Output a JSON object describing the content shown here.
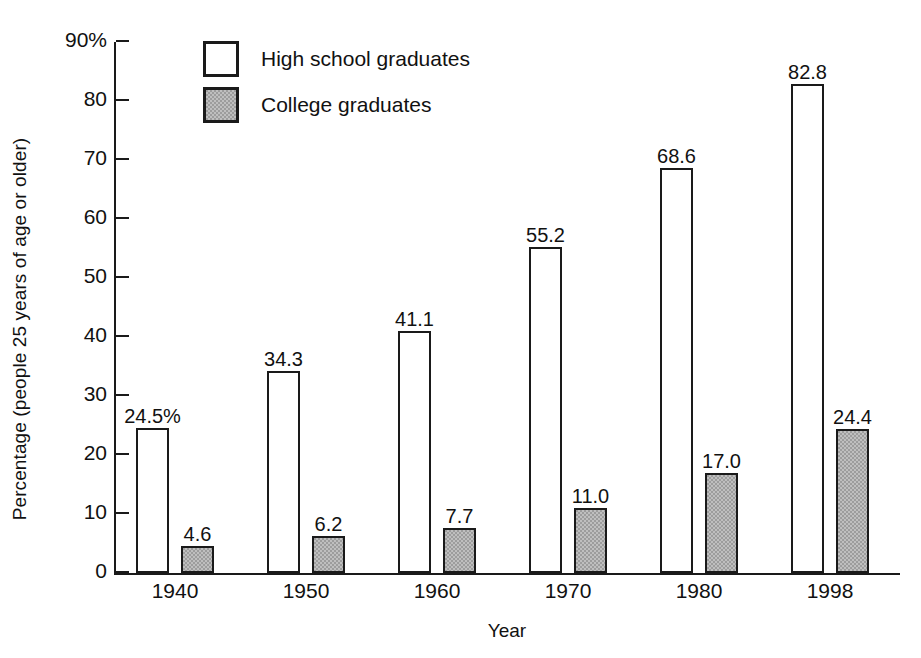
{
  "chart_data": {
    "type": "bar",
    "title": "",
    "xlabel": "Year",
    "ylabel": "Percentage (people 25 years of age or older)",
    "categories": [
      "1940",
      "1950",
      "1960",
      "1970",
      "1980",
      "1998"
    ],
    "series": [
      {
        "name": "High school graduates",
        "values": [
          24.5,
          34.3,
          41.1,
          55.2,
          68.6,
          82.8
        ],
        "labels": [
          "24.5%",
          "34.3",
          "41.1",
          "55.2",
          "68.6",
          "82.8"
        ],
        "fill": "#ffffff",
        "stroke": "#1a1a1a"
      },
      {
        "name": "College graduates",
        "values": [
          4.6,
          6.2,
          7.7,
          11.0,
          17.0,
          24.4
        ],
        "labels": [
          "4.6",
          "6.2",
          "7.7",
          "11.0",
          "17.0",
          "24.4"
        ],
        "fill": "#9d9d9d",
        "stroke": "#1a1a1a"
      }
    ],
    "ylim": [
      0,
      90
    ],
    "yticks": [
      0,
      10,
      20,
      30,
      40,
      50,
      60,
      70,
      80,
      90
    ],
    "ytick_labels": [
      "0",
      "10",
      "20",
      "30",
      "40",
      "50",
      "60",
      "70",
      "80",
      "90%"
    ],
    "grid": false,
    "legend_position": "top-left-inside"
  },
  "legend": {
    "items": [
      {
        "label": "High school graduates",
        "swatch": "white-square-swatch"
      },
      {
        "label": "College graduates",
        "swatch": "gray-square-swatch"
      }
    ]
  }
}
